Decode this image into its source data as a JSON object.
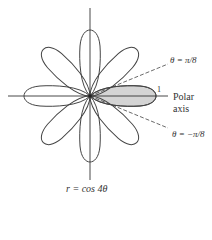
{
  "figure": {
    "equation_label": "r = cos 4θ",
    "polar_axis_label_line1": "Polar",
    "polar_axis_label_line2": "axis",
    "radius_tick_label": "1",
    "upper_ray_label": "θ = π/8",
    "lower_ray_label": "θ = −π/8",
    "petal_count": 8,
    "shaded_petal": "right petal between θ = −π/8 and θ = π/8",
    "colors": {
      "curve": "#444444",
      "shade": "#d4d4d4",
      "axes": "#333333"
    }
  }
}
